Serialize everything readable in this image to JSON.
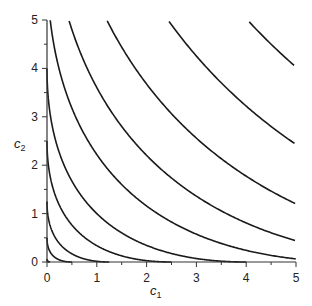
{
  "chart_data": {
    "type": "line",
    "title": "",
    "xlabel": "c1",
    "ylabel": "c2",
    "xlim": [
      0,
      5
    ],
    "ylim": [
      0,
      5
    ],
    "x_ticks": [
      0,
      1,
      2,
      3,
      4,
      5
    ],
    "y_ticks": [
      0,
      1,
      2,
      3,
      4,
      5
    ],
    "minor_ticks": 0.5,
    "grid": false,
    "legend": null,
    "series": [
      {
        "name": "level-1",
        "level": 0.06,
        "axis_intercept": 0.06
      },
      {
        "name": "level-2",
        "level": 0.5,
        "axis_intercept": 0.5
      },
      {
        "name": "level-3",
        "level": 1.25,
        "axis_intercept": 1.25
      },
      {
        "name": "level-4",
        "level": 2.5,
        "axis_intercept": 2.5
      },
      {
        "name": "level-5",
        "level": 4.0,
        "axis_intercept": 4.0
      },
      {
        "name": "level-6",
        "level": 6.2,
        "top_edge_c1": 0.06,
        "right_edge_c2": null
      },
      {
        "name": "level-7",
        "level": 8.4,
        "top_edge_c1": 0.44,
        "right_edge_c2": 0.12
      },
      {
        "name": "level-8",
        "level": 11.1,
        "top_edge_c1": 1.22,
        "right_edge_c2": 0.47
      },
      {
        "name": "level-9",
        "level": 14.4,
        "top_edge_c1": 2.45,
        "right_edge_c2": 1.28
      },
      {
        "name": "level-10",
        "level": 18.0,
        "top_edge_c1": 4.06,
        "right_edge_c2": 4.1
      }
    ]
  },
  "labels": {
    "x_axis": "c",
    "x_axis_sub": "1",
    "y_axis": "c",
    "y_axis_sub": "2",
    "x_tick_labels": [
      "0",
      "1",
      "2",
      "3",
      "4",
      "5"
    ],
    "y_tick_labels": [
      "0",
      "1",
      "2",
      "3",
      "4",
      "5"
    ]
  },
  "colors": {
    "curve": "#1a1a1a",
    "axis": "#333333",
    "background": "#ffffff"
  }
}
